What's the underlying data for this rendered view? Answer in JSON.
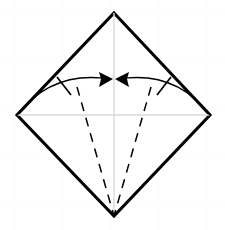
{
  "figure": {
    "type": "origami-step",
    "canvas": {
      "width": 225,
      "height": 230
    },
    "background_color": "#ffffff",
    "grid_color": "#fbfbfb"
  },
  "paper": {
    "name": "square-sheet",
    "shape": "diamond",
    "outline_color": "#000000",
    "fill_color": "#ffffff",
    "stroke_width": 3.1,
    "vertices": {
      "top": {
        "x": 114,
        "y": 13
      },
      "right": {
        "x": 210,
        "y": 115
      },
      "bottom": {
        "x": 114,
        "y": 216
      },
      "left": {
        "x": 17,
        "y": 115
      }
    },
    "points_path": "114,13 210,115 114,216 17,115"
  },
  "guides": {
    "color": "#d9d9d9",
    "stroke_width": 1.4,
    "lines": [
      {
        "name": "vertical-center-axis",
        "x1": 114,
        "y1": 13,
        "x2": 114,
        "y2": 216
      },
      {
        "name": "horizontal-center-axis",
        "x1": 17,
        "y1": 115,
        "x2": 210,
        "y2": 115
      }
    ],
    "center": {
      "x": 114,
      "y": 115
    }
  },
  "folds": {
    "style": "valley",
    "line_color": "#000000",
    "stroke_width": 1.5,
    "dash_pattern": "9 7",
    "lines": [
      {
        "name": "left-valley-fold",
        "x1": 77,
        "y1": 87,
        "x2": 114,
        "y2": 216
      },
      {
        "name": "right-valley-fold",
        "x1": 151,
        "y1": 87,
        "x2": 114,
        "y2": 216
      }
    ]
  },
  "arrows": {
    "color": "#000000",
    "stroke_width": 1.7,
    "items": [
      {
        "name": "left-fold-arrow",
        "direction": "right",
        "from": {
          "x": 17,
          "y": 115
        },
        "to": {
          "x": 110,
          "y": 79
        },
        "path": "M 17 115 Q 52 70 110 79",
        "head_points": "113,79 99,72 101,79 99,87",
        "tick": {
          "x1": 57,
          "y1": 77,
          "x2": 71,
          "y2": 95
        }
      },
      {
        "name": "right-fold-arrow",
        "direction": "left",
        "from": {
          "x": 210,
          "y": 115
        },
        "to": {
          "x": 118,
          "y": 79
        },
        "path": "M 210 115 Q 176 70 118 79",
        "head_points": "115,79 129,72 127,79 129,87",
        "tick": {
          "x1": 171,
          "y1": 77,
          "x2": 157,
          "y2": 95
        }
      }
    ]
  }
}
